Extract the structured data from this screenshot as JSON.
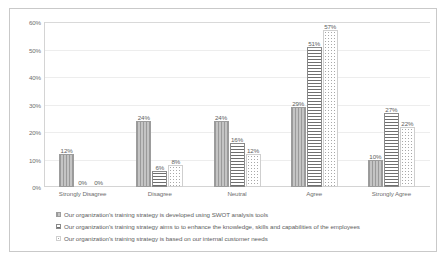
{
  "chart_data": {
    "type": "bar",
    "title": "",
    "subtitle": "",
    "xlabel": "",
    "ylabel": "",
    "ylim": [
      0,
      60
    ],
    "ytick_labels": [
      "0%",
      "10%",
      "20%",
      "30%",
      "40%",
      "50%",
      "60%"
    ],
    "ytick_values": [
      0,
      10,
      20,
      30,
      40,
      50,
      60
    ],
    "grid": true,
    "legend_position": "bottom-left",
    "categories": [
      "Strongly Disagree",
      "Disagree",
      "Neutral",
      "Agree",
      "Strongly Agree"
    ],
    "series": [
      {
        "name": "Our organization's training strategy is developed using SWOT analysis tools",
        "pattern": "vertical-stripes",
        "values": [
          12,
          24,
          24,
          29,
          10
        ],
        "labels": [
          "12%",
          "24%",
          "24%",
          "29%",
          "10%"
        ]
      },
      {
        "name": "Our organization's training strategy aims to to enhance the knowledge, skills and capabilities of the employees",
        "pattern": "horizontal-stripes",
        "values": [
          0,
          6,
          16,
          51,
          27
        ],
        "labels": [
          "0%",
          "6%",
          "16%",
          "51%",
          "27%"
        ]
      },
      {
        "name": "Our organization's training strategy is based on our internal customer needs",
        "pattern": "dotted",
        "values": [
          0,
          8,
          12,
          57,
          22
        ],
        "labels": [
          "0%",
          "8%",
          "12%",
          "57%",
          "22%"
        ]
      }
    ],
    "colors": {
      "series_0": "#b2b2b2",
      "series_1": "#6f6f6f",
      "series_2": "#a8a8a8",
      "axis": "#d4d4d4",
      "gridline": "#ededed",
      "text": "#6f6f6f",
      "border": "#c9c9c9",
      "background": "#ffffff"
    }
  }
}
